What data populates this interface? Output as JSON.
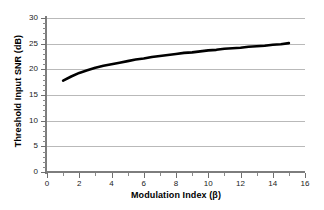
{
  "chart_data": {
    "type": "line",
    "title": "",
    "xlabel": "Modulation Index (β)",
    "ylabel": "Threshold Input SNR (dB)",
    "xlim": [
      0,
      16
    ],
    "ylim": [
      0,
      30
    ],
    "xticks": [
      0,
      2,
      4,
      6,
      8,
      10,
      12,
      14,
      16
    ],
    "yticks": [
      0,
      5,
      10,
      15,
      20,
      25,
      30
    ],
    "xtick_labels": [
      "0",
      "2",
      "4",
      "6",
      "8",
      "10",
      "12",
      "14",
      "16"
    ],
    "ytick_labels": [
      "0",
      "5",
      "10",
      "15",
      "20",
      "25",
      "30"
    ],
    "x_minor_interval": 1,
    "y_minor_interval": 1,
    "grid": "horizontal",
    "legend": "none",
    "series": [
      {
        "name": "Threshold Input SNR",
        "color": "#000000",
        "line_width": 2.6,
        "x": [
          1,
          1.5,
          2,
          2.5,
          3,
          3.5,
          4,
          4.5,
          5,
          5.5,
          6,
          6.5,
          7,
          7.5,
          8,
          8.5,
          9,
          9.5,
          10,
          10.5,
          11,
          11.5,
          12,
          12.5,
          13,
          13.5,
          14,
          14.5,
          15
        ],
        "values": [
          17.8,
          18.6,
          19.3,
          19.8,
          20.3,
          20.7,
          21.0,
          21.3,
          21.6,
          21.9,
          22.1,
          22.4,
          22.6,
          22.8,
          23.0,
          23.2,
          23.3,
          23.5,
          23.7,
          23.8,
          24.0,
          24.1,
          24.2,
          24.4,
          24.5,
          24.6,
          24.8,
          24.9,
          25.1
        ]
      }
    ]
  },
  "axes": {
    "axis_color": "#7d7d7d",
    "grid_color": "#b9b9b9",
    "background": "#ffffff"
  }
}
